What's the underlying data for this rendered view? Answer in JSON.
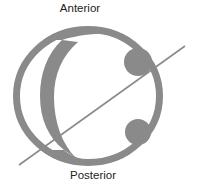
{
  "diagram": {
    "labels": {
      "top": "Anterior",
      "bottom": "Posterior"
    },
    "colors": {
      "fill": "#8a8a8a",
      "background": "#ffffff",
      "text": "#222222"
    },
    "shapes": {
      "outer_ring": "ring",
      "inner_band": "c-shaped-band",
      "bumps": [
        "upper-bump",
        "lower-bump"
      ],
      "axis_line": "diagonal-line"
    }
  }
}
